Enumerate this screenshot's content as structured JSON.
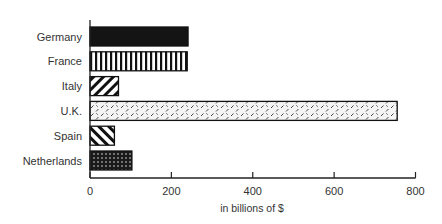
{
  "chart_data": {
    "type": "bar",
    "orientation": "horizontal",
    "title": "",
    "xlabel": "in billions of $",
    "ylabel": "",
    "categories": [
      "Germany",
      "France",
      "Italy",
      "U.K.",
      "Spain",
      "Netherlands"
    ],
    "values": [
      241,
      239,
      70,
      755,
      60,
      103
    ],
    "xlim": [
      0,
      800
    ],
    "xticks": [
      0,
      200,
      400,
      600,
      800
    ],
    "grid": false,
    "legend": null,
    "patterns": [
      "solid-black",
      "vertical-stripes",
      "diagonal-stripes-down",
      "diagonal-dashes-light",
      "diagonal-stripes-up",
      "dots-dark"
    ]
  },
  "axis": {
    "xlabel": "in billions of $",
    "ticks": [
      "0",
      "200",
      "400",
      "600",
      "800"
    ]
  },
  "colors": {
    "ink": "#1a1a1a",
    "background": "#ffffff"
  }
}
